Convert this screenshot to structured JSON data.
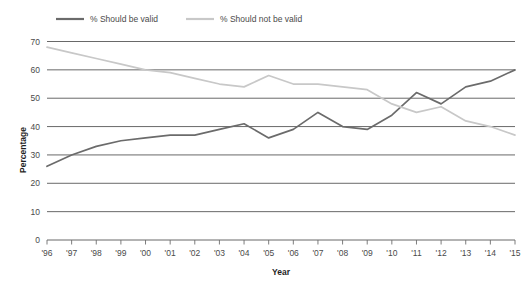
{
  "chart_data": {
    "type": "line",
    "title": "",
    "xlabel": "Year",
    "ylabel": "Percentage",
    "ylim": [
      0,
      70
    ],
    "yticks": [
      0,
      10,
      20,
      30,
      40,
      50,
      60,
      70
    ],
    "grid": true,
    "legend_position": "top-left",
    "categories": [
      "'96",
      "'97",
      "'98",
      "'99",
      "'00",
      "'01",
      "'02",
      "'03",
      "'04",
      "'05",
      "'06",
      "'07",
      "'08",
      "'09",
      "'10",
      "'11",
      "'12",
      "'13",
      "'14",
      "'15"
    ],
    "series": [
      {
        "name": "% Should be valid",
        "color": "#6b6b6b",
        "values": [
          26,
          30,
          33,
          35,
          36,
          37,
          37,
          39,
          41,
          36,
          39,
          45,
          40,
          39,
          44,
          52,
          48,
          54,
          56,
          60
        ]
      },
      {
        "name": "% Should not be valid",
        "color": "#c8c8c8",
        "values": [
          68,
          66,
          64,
          62,
          60,
          59,
          57,
          55,
          54,
          58,
          55,
          55,
          54,
          53,
          48,
          45,
          47,
          42,
          40,
          37
        ]
      }
    ]
  },
  "legend": {
    "items": [
      {
        "label": "% Should be valid",
        "color": "#6b6b6b"
      },
      {
        "label": "% Should not be valid",
        "color": "#c8c8c8"
      }
    ]
  },
  "axes": {
    "y_title": "Percentage",
    "x_title": "Year"
  }
}
